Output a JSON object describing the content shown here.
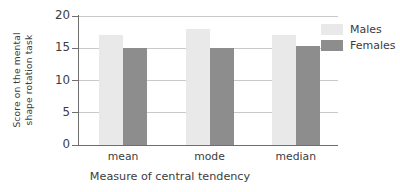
{
  "chart_data": {
    "type": "bar",
    "title": "",
    "categories": [
      "mean",
      "mode",
      "median"
    ],
    "series": [
      {
        "name": "Males",
        "color": "#e9e9e9",
        "values": [
          17,
          18,
          17
        ]
      },
      {
        "name": "Females",
        "color": "#8d8d8d",
        "values": [
          15,
          15,
          15.3
        ]
      }
    ],
    "xlabel": "Measure of central tendency",
    "ylabel_line1": "Score on the mental",
    "ylabel_line2": "shape rotation task",
    "ylabel": "Score on the mental shape rotation task",
    "ylim": [
      0,
      20
    ],
    "yticks": [
      0,
      5,
      10,
      15,
      20
    ],
    "ytick_labels": [
      "0",
      "5",
      "10",
      "15",
      "20"
    ],
    "grid": true,
    "grid_axis": "y",
    "legend_position": "top-right",
    "legend_entries": [
      "Males",
      "Females"
    ]
  },
  "axes": {
    "y_ticks": [
      {
        "label": "20",
        "value": 20
      },
      {
        "label": "15",
        "value": 15
      },
      {
        "label": "10",
        "value": 10
      },
      {
        "label": "5",
        "value": 5
      },
      {
        "label": "0",
        "value": 0
      }
    ]
  },
  "legend": {
    "males_label": "Males",
    "females_label": "Females"
  },
  "groups": [
    {
      "label": "mean",
      "males": 17,
      "females": 15
    },
    {
      "label": "mode",
      "males": 18,
      "females": 15
    },
    {
      "label": "median",
      "males": 17,
      "females": 15.3
    }
  ]
}
